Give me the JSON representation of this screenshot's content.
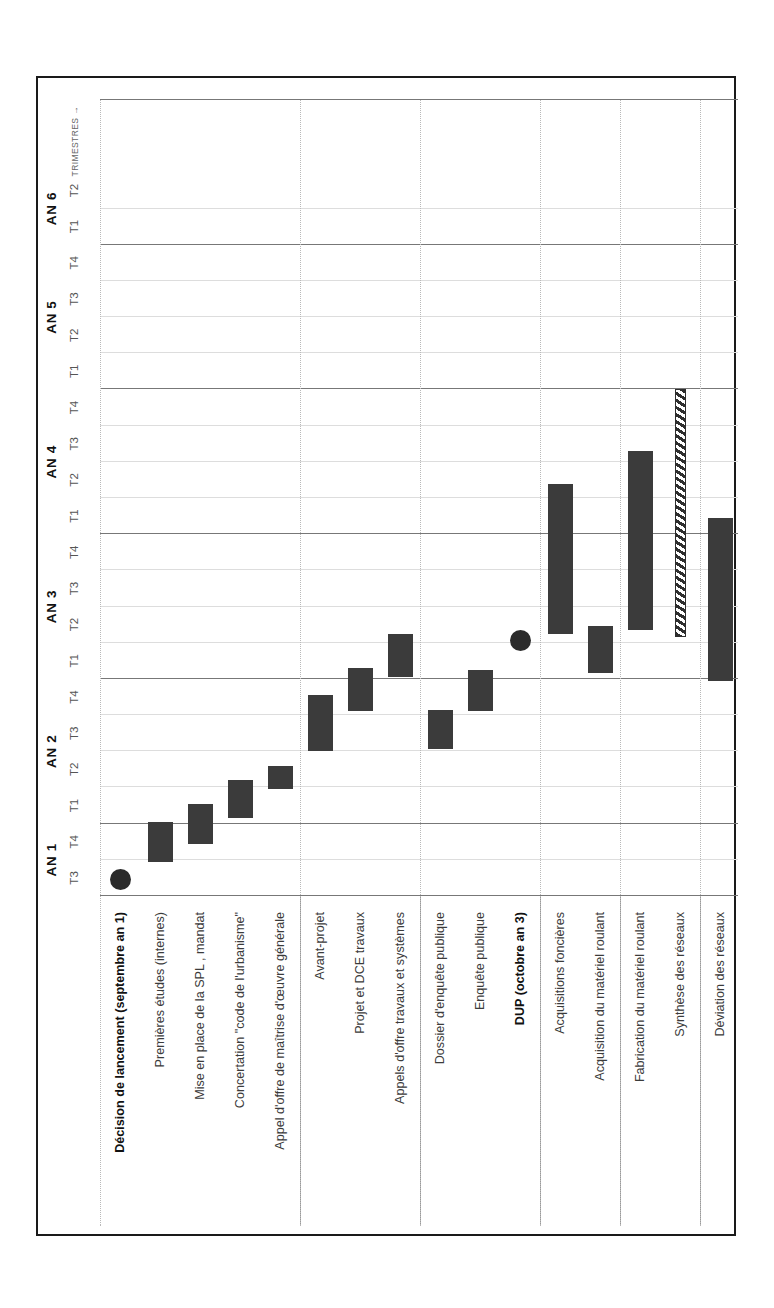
{
  "chart_data": {
    "type": "bar",
    "title": "",
    "xlabel": "TRIMESTRES →",
    "ylabel": "",
    "orientation": "gantt-horizontal-rotated",
    "axis": {
      "start_label": "T3",
      "years": [
        {
          "label": "AN 1",
          "quarters": [
            "T3",
            "T4"
          ]
        },
        {
          "label": "AN 2",
          "quarters": [
            "T1",
            "T2",
            "T3",
            "T4"
          ]
        },
        {
          "label": "AN 3",
          "quarters": [
            "T1",
            "T2",
            "T3",
            "T4"
          ]
        },
        {
          "label": "AN 4",
          "quarters": [
            "T1",
            "T2",
            "T3",
            "T4"
          ]
        },
        {
          "label": "AN 5",
          "quarters": [
            "T1",
            "T2",
            "T3",
            "T4"
          ]
        },
        {
          "label": "AN 6",
          "quarters": [
            "T1",
            "T2"
          ]
        }
      ],
      "total_quarters": 22,
      "grid": true
    },
    "groups": [
      {
        "name": "phase-etudes-prealables",
        "rows": [
          0,
          1,
          2,
          3,
          4
        ]
      },
      {
        "name": "phase-conception",
        "rows": [
          5,
          6,
          7
        ]
      },
      {
        "name": "phase-enquete-dup",
        "rows": [
          8,
          9,
          10
        ]
      },
      {
        "name": "phase-materiel-roulant",
        "rows": [
          11,
          12
        ]
      },
      {
        "name": "phase-reseaux",
        "rows": [
          13,
          14
        ]
      },
      {
        "name": "phase-travaux",
        "rows": [
          15,
          16,
          17
        ]
      }
    ],
    "rows": [
      {
        "label": "Décision de lancement (septembre an 1)",
        "bold": true,
        "kind": "milestone",
        "start": 0.0,
        "end": 0.0,
        "marker_q": 0.45
      },
      {
        "label": "Premières études (internes)",
        "bold": false,
        "kind": "bar",
        "start": 0.95,
        "end": 2.05
      },
      {
        "label": "Mise en place de la SPL , mandat",
        "bold": false,
        "kind": "bar",
        "start": 1.45,
        "end": 2.55
      },
      {
        "label": "Concertation \"code de l'urbanisme\"",
        "bold": false,
        "kind": "bar",
        "start": 2.15,
        "end": 3.2
      },
      {
        "label": "Appel d'offre de maîtrise d'œuvre générale",
        "bold": false,
        "kind": "bar",
        "start": 2.95,
        "end": 3.6
      },
      {
        "label": "Avant-projet",
        "bold": false,
        "kind": "bar",
        "start": 4.0,
        "end": 5.55
      },
      {
        "label": "Projet et DCE travaux",
        "bold": false,
        "kind": "bar",
        "start": 5.1,
        "end": 6.3
      },
      {
        "label": "Appels d'offre travaux et systèmes",
        "bold": false,
        "kind": "bar",
        "start": 6.05,
        "end": 7.25
      },
      {
        "label": "Dossier d'enquête publique",
        "bold": false,
        "kind": "bar",
        "start": 4.05,
        "end": 5.15
      },
      {
        "label": "Enquête publique",
        "bold": false,
        "kind": "bar",
        "start": 5.1,
        "end": 6.25
      },
      {
        "label": "DUP (octobre an 3)",
        "bold": true,
        "kind": "milestone",
        "start": 0.0,
        "end": 0.0,
        "marker_q": 7.05
      },
      {
        "label": "Acquisitions foncières",
        "bold": false,
        "kind": "bar",
        "start": 7.25,
        "end": 11.4
      },
      {
        "label": "Acquisition du matériel roulant",
        "bold": false,
        "kind": "bar",
        "start": 6.15,
        "end": 7.45
      },
      {
        "label": "Fabrication du matériel roulant",
        "bold": false,
        "kind": "bar",
        "start": 7.35,
        "end": 12.3
      },
      {
        "label": "Synthèse des réseaux",
        "bold": false,
        "kind": "hatch",
        "start": 7.15,
        "end": 14.0
      },
      {
        "label": "Déviation des réseaux",
        "bold": false,
        "kind": "bar",
        "start": 5.95,
        "end": 10.45
      },
      {
        "label": "Travaux",
        "bold": false,
        "kind": "bar",
        "start": 10.55,
        "end": 17.45
      },
      {
        "label": "Essais et marche à blanc",
        "bold": false,
        "kind": "bar",
        "start": 18.7,
        "end": 20.3
      },
      {
        "label": "Mise en service (juin an 6)",
        "bold": true,
        "kind": "milestone",
        "start": 0.0,
        "end": 0.0,
        "marker_q": 21.1
      }
    ],
    "colors": {
      "bar": "#3b3b3b",
      "milestone": "#2b2b2b",
      "hatch_stroke": "#2e2e2e",
      "grid_major": "#777777",
      "grid_minor": "#dddddd",
      "frame": "#1a1a1a",
      "label_text": "#3b3b3b",
      "label_bold": "#111111"
    }
  }
}
